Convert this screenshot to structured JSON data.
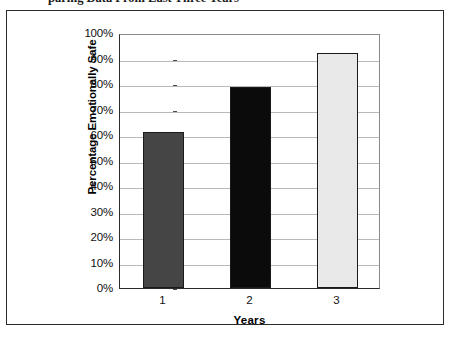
{
  "caption": {
    "text": "paring Data From Last Three Years"
  },
  "chart_data": {
    "type": "bar",
    "title": "",
    "categories": [
      "1",
      "2",
      "3"
    ],
    "values": [
      61,
      79,
      92
    ],
    "xlabel": "Years",
    "ylabel": "Percentage Emotionally Safe",
    "ylim": [
      0,
      100
    ],
    "ytick_labels": [
      "100%",
      "90%",
      "80%",
      "70%",
      "60%",
      "50%",
      "40%",
      "30%",
      "20%",
      "10%",
      "0%"
    ],
    "ytick_values": [
      100,
      90,
      80,
      70,
      60,
      50,
      40,
      30,
      20,
      10,
      0
    ],
    "grid": true,
    "legend": "none",
    "bar_colors": [
      "#454545",
      "#0b0b0b",
      "#e9e9e9"
    ],
    "bar_border_color": "#1a1a1a",
    "plot_background": "#ffffff",
    "gridline_color": "#b9b9b9",
    "axis_color": "#2b2b2b",
    "frame_color": "#2b2b2b"
  }
}
